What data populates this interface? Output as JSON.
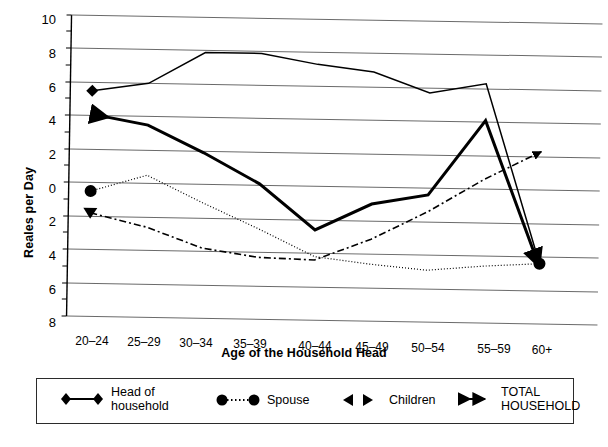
{
  "chart_data": {
    "type": "line",
    "title": "",
    "xlabel": "Age of the Household Head",
    "ylabel": "Reales per Day",
    "categories": [
      "20–24",
      "25–29",
      "30–34",
      "35–39",
      "40–44",
      "45–49",
      "50–54",
      "55–59",
      "60+"
    ],
    "ylim": [
      -8,
      10
    ],
    "ytick_values": [
      10,
      8,
      6,
      4,
      2,
      0,
      -2,
      -4,
      -6,
      -8
    ],
    "ytick_labels": [
      "10",
      "8",
      "6",
      "4",
      "2",
      "0",
      "2",
      "4",
      "6",
      "8"
    ],
    "grid": true,
    "legend_position": "bottom",
    "series": [
      {
        "name": "Head of household",
        "marker": "diamond",
        "linestyle": "solid",
        "values": [
          5.5,
          6.0,
          7.9,
          7.9,
          7.3,
          6.9,
          5.7,
          6.3,
          -4.4
        ]
      },
      {
        "name": "Spouse",
        "marker": "circle",
        "linestyle": "dotted",
        "values": [
          -0.5,
          0.5,
          -1.1,
          -2.6,
          -4.2,
          -4.6,
          -4.9,
          -4.6,
          -4.4
        ]
      },
      {
        "name": "Children",
        "marker": "triangle",
        "linestyle": "dash-dot",
        "values": [
          -1.8,
          -2.6,
          -3.8,
          -4.3,
          -4.4,
          -3.1,
          -1.4,
          0.6,
          2.3
        ]
      },
      {
        "name": "TOTAL HOUSEHOLD",
        "marker": "double-arrow",
        "linestyle": "solid-thick",
        "values": [
          4.1,
          3.5,
          1.9,
          0.1,
          -2.6,
          -1.0,
          -0.4,
          4.1,
          -4.6
        ]
      }
    ]
  },
  "legend": {
    "items": [
      {
        "label": "Head of\nhousehold",
        "marker": "diamond"
      },
      {
        "label": "Spouse",
        "marker": "circle"
      },
      {
        "label": "Children",
        "marker": "triangle"
      },
      {
        "label": "TOTAL\nHOUSEHOLD",
        "marker": "double-arrow"
      }
    ]
  }
}
